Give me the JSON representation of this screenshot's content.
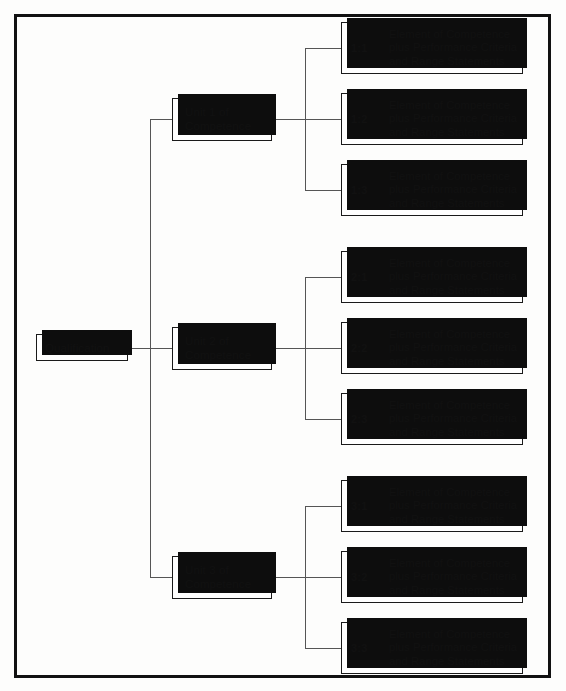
{
  "diagram": {
    "root": {
      "label": "Qualification"
    },
    "units": [
      {
        "id": "unit-1",
        "label_line1": "Unit 1 of",
        "label_line2": "Competence"
      },
      {
        "id": "unit-2",
        "label_line1": "Unit 2 of",
        "label_line2": "Competence"
      },
      {
        "id": "unit-3",
        "label_line1": "Unit 3 of",
        "label_line2": "Competence"
      }
    ],
    "elements": [
      {
        "code": "1:1",
        "line1": "Element of Competence",
        "line2": "plus Performance Criteria",
        "line3": "and Range Statements"
      },
      {
        "code": "1:2",
        "line1": "Element of Competence",
        "line2": "plus Performance Criteria",
        "line3": "and Range Statements"
      },
      {
        "code": "1:3",
        "line1": "Element of Competence",
        "line2": "plus Performance Criteria",
        "line3": "and Range Statements"
      },
      {
        "code": "2:1",
        "line1": "Element of Competence",
        "line2": "plus Performance Criteria",
        "line3": "and Range Statements"
      },
      {
        "code": "2:2",
        "line1": "Element of Competence",
        "line2": "plus Performance Criteria",
        "line3": "and Range Statements"
      },
      {
        "code": "2:3",
        "line1": "Element of Competence",
        "line2": "plus Performance Criteria",
        "line3": "and Range Statements"
      },
      {
        "code": "3:1",
        "line1": "Element of Competence",
        "line2": "plus Performance Criteria",
        "line3": "and Range Statements"
      },
      {
        "code": "3:2",
        "line1": "Element of Competence",
        "line2": "plus Performance Criteria",
        "line3": "and Range Statements"
      },
      {
        "code": "3:3",
        "line1": "Element of Competence",
        "line2": "plus Performance Criteria",
        "line3": "and Range Statements"
      }
    ],
    "colors": {
      "frame": "#111111",
      "box_border": "#1a1a1a",
      "box_shadow": "#0d0d0d",
      "connector": "#555555",
      "text": "#111111",
      "background": "#fdfdfc"
    }
  }
}
